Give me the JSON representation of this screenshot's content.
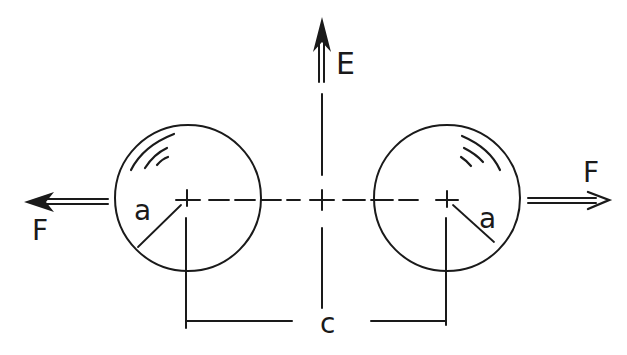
{
  "diagram": {
    "labels": {
      "field": "E",
      "force_left": "F",
      "force_right": "F",
      "radius_left": "a",
      "radius_right": "a",
      "separation": "c"
    },
    "colors": {
      "ink": "#1a1a1a",
      "background": "#ffffff"
    }
  }
}
